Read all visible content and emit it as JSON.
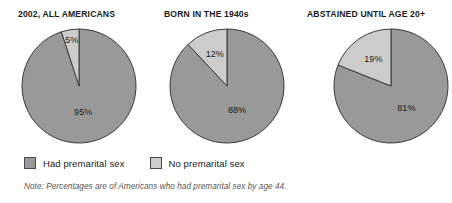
{
  "chart_data": {
    "type": "pie",
    "title": "",
    "legend_position": "bottom-left",
    "grid": false,
    "note": "Note: Percentages are of Americans who had premarital sex by age 44.",
    "legend": [
      {
        "label": "Had premarital sex",
        "color": "#999999",
        "swatch_name": "legend-swatch-had-premarital-sex"
      },
      {
        "label": "No premarital sex",
        "color": "#cccccc",
        "swatch_name": "legend-swatch-no-premarital-sex"
      }
    ],
    "categories": [
      "Had premarital sex",
      "No premarital sex"
    ],
    "charts": [
      {
        "title": "2002, ALL AMERICANS",
        "slices": [
          {
            "label": "Had premarital sex",
            "value": 95,
            "display": "95%",
            "color": "#999999"
          },
          {
            "label": "No premarital sex",
            "value": 5,
            "display": "5%",
            "color": "#cccccc"
          }
        ]
      },
      {
        "title": "BORN IN THE 1940s",
        "slices": [
          {
            "label": "Had premarital sex",
            "value": 88,
            "display": "88%",
            "color": "#999999"
          },
          {
            "label": "No premarital sex",
            "value": 12,
            "display": "12%",
            "color": "#cccccc"
          }
        ]
      },
      {
        "title": "ABSTAINED UNTIL AGE 20+",
        "slices": [
          {
            "label": "Had premarital sex",
            "value": 81,
            "display": "81%",
            "color": "#999999"
          },
          {
            "label": "No premarital sex",
            "value": 19,
            "display": "19%",
            "color": "#cccccc"
          }
        ]
      }
    ]
  }
}
